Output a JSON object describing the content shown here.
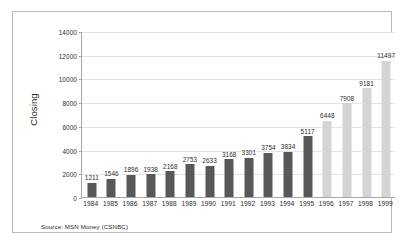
{
  "chart_data": {
    "type": "bar",
    "title": "",
    "subtitle": "",
    "xlabel": "",
    "ylabel": "Closing",
    "ylim": [
      0,
      14000
    ],
    "ytick_values": [
      14000,
      12000,
      10000,
      8000,
      6000,
      4000,
      2000,
      0
    ],
    "ytick_labels": [
      "14000",
      "12000",
      "10000",
      "8000",
      "6000",
      "4000",
      "2000",
      "0"
    ],
    "grid": true,
    "legend": null,
    "categories": [
      "1984",
      "1985",
      "1986",
      "1987",
      "1988",
      "1989",
      "1990",
      "1991",
      "1992",
      "1993",
      "1994",
      "1995",
      "1996",
      "1997",
      "1998",
      "1999"
    ],
    "values": [
      1211,
      1546,
      1896,
      1938,
      2168,
      2753,
      2633,
      3168,
      3301,
      3754,
      3834,
      5117,
      6448,
      7908,
      9181,
      11497
    ],
    "data_labels": [
      "1211",
      "1546",
      "1896",
      "1938",
      "2168",
      "2753",
      "2633",
      "3168",
      "3301",
      "3754",
      "3834",
      "5117",
      "6448",
      "7908",
      "9181",
      "11497"
    ],
    "bar_groups": [
      "dark",
      "dark",
      "dark",
      "dark",
      "dark",
      "dark",
      "dark",
      "dark",
      "dark",
      "dark",
      "dark",
      "dark",
      "light",
      "light",
      "light",
      "light"
    ],
    "annotations": [
      "Source: MSN Money (CSNBC)"
    ]
  },
  "colors": {
    "bar_dark": "#585858",
    "bar_light": "#d4d4d4",
    "gridline": "#e3e3e3",
    "axis": "#a6a6a6",
    "frame": "#b9b9b9",
    "text": "#2b2b2b",
    "background": "#ffffff"
  },
  "source": {
    "text": "Source: MSN Money (CSNBC)"
  }
}
